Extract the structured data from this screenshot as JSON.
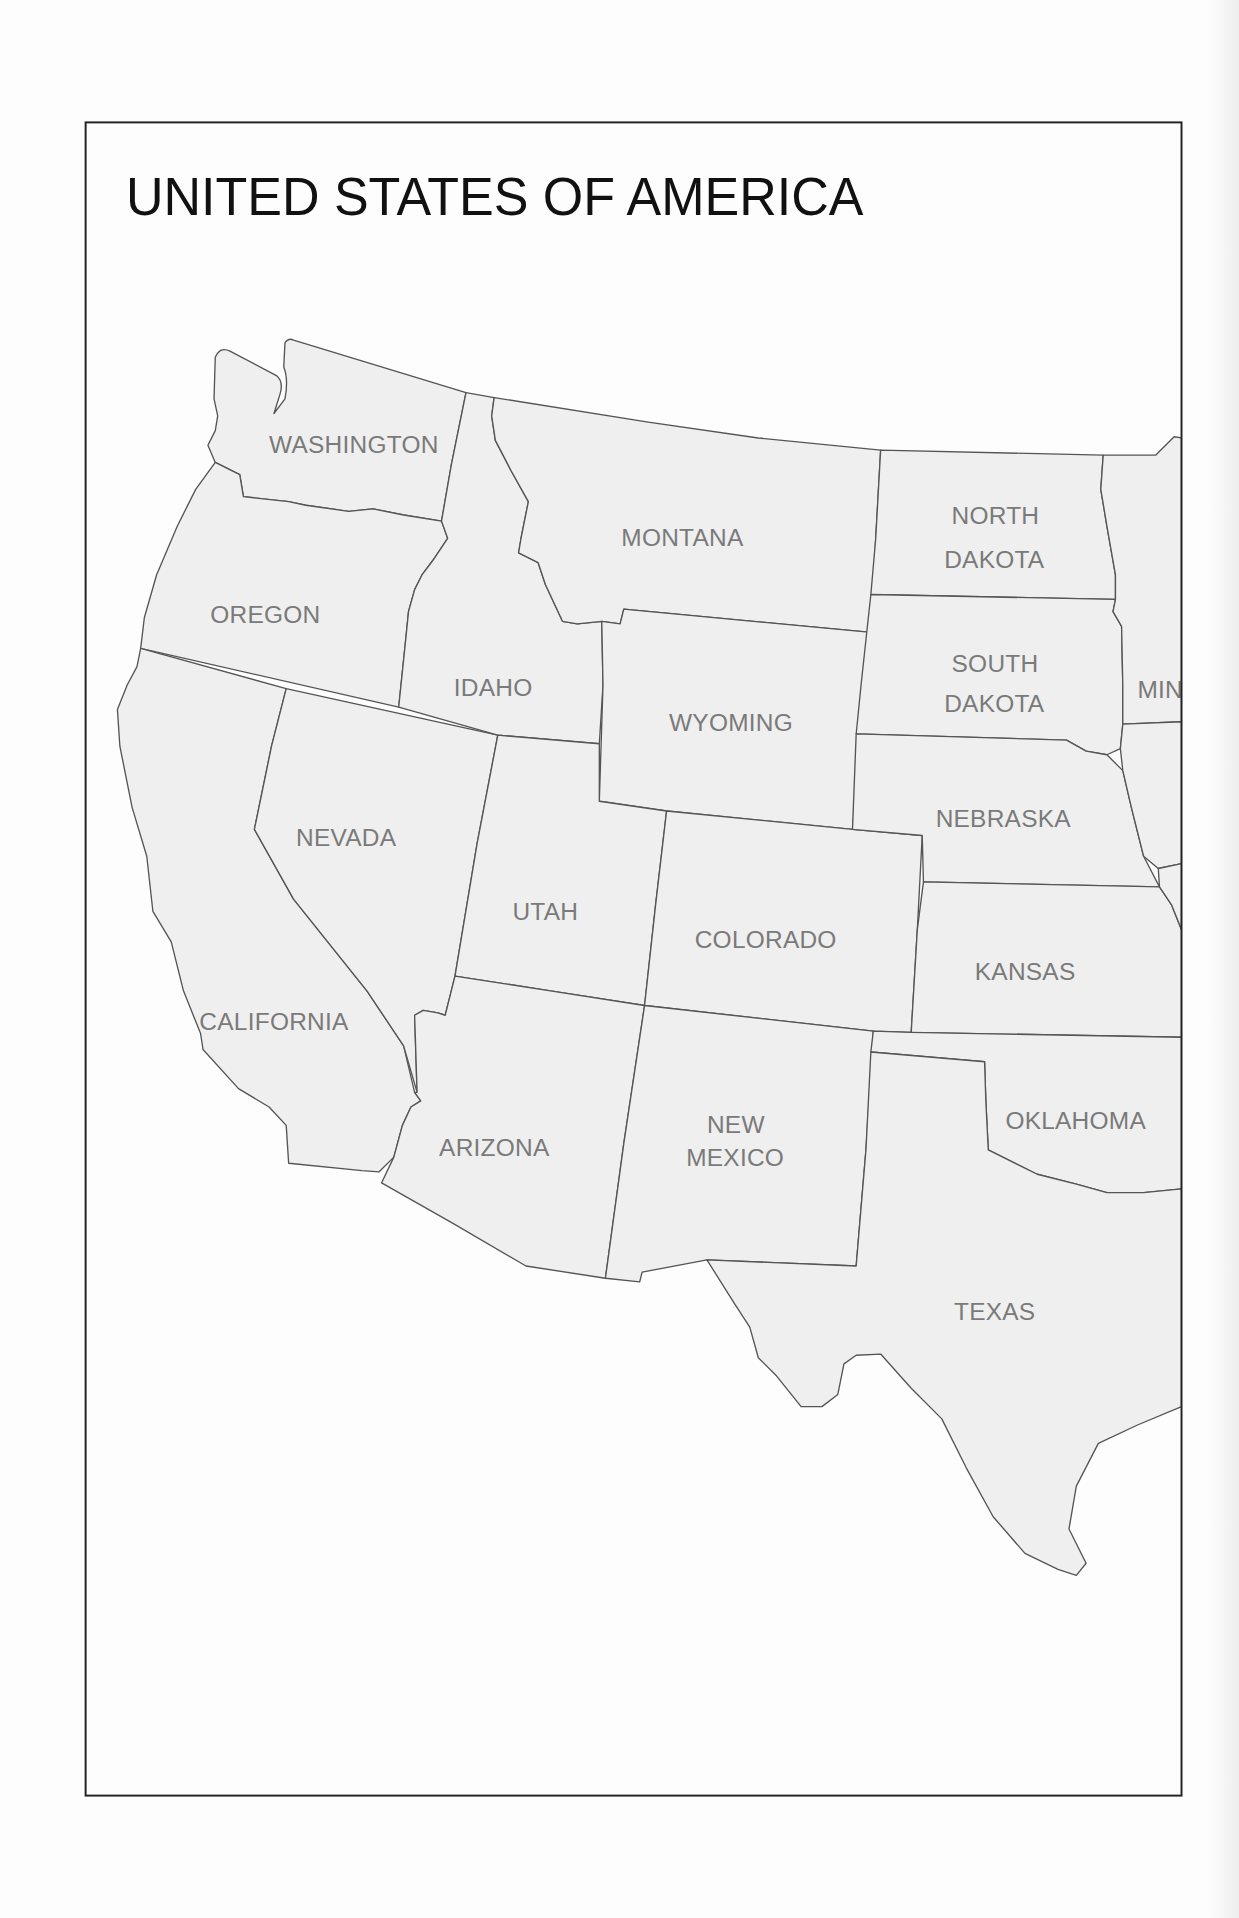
{
  "map": {
    "title": "UNITED STATES OF AMERICA",
    "colors": {
      "state_fill": "#efefef",
      "state_border": "#555555",
      "label": "#7a7a7a",
      "title": "#111111",
      "frame": "#222222"
    },
    "labels": {
      "washington": "WASHINGTON",
      "oregon": "OREGON",
      "california": "CALIFORNIA",
      "nevada": "NEVADA",
      "idaho": "IDAHO",
      "montana": "MONTANA",
      "wyoming": "WYOMING",
      "utah": "UTAH",
      "colorado": "COLORADO",
      "arizona": "ARIZONA",
      "new_mexico_1": "NEW",
      "new_mexico_2": "MEXICO",
      "north_dakota_1": "NORTH",
      "north_dakota_2": "DAKOTA",
      "south_dakota_1": "SOUTH",
      "south_dakota_2": "DAKOTA",
      "nebraska": "NEBRASKA",
      "kansas": "KANSAS",
      "oklahoma": "OKLAHOMA",
      "texas": "TEXAS",
      "minnesota_partial": "MIN"
    }
  }
}
